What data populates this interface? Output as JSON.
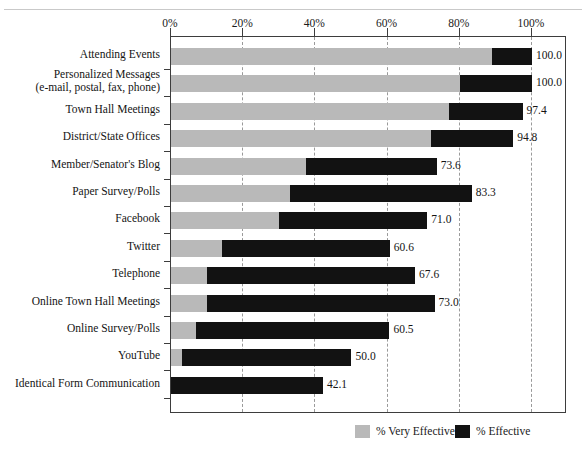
{
  "chart_data": {
    "type": "bar",
    "orientation": "horizontal",
    "stacked": true,
    "title": "",
    "subtitle": "",
    "xlabel": "",
    "ylabel": "",
    "xlim": [
      0,
      100
    ],
    "grid": true,
    "legend_position": "bottom-right",
    "xticks": [
      "0%",
      "20%",
      "40%",
      "60%",
      "80%",
      "100%"
    ],
    "xtick_values": [
      0,
      20,
      40,
      60,
      80,
      100
    ],
    "categories": [
      "Attending Events",
      "Personalized Messages (e-mail, postal, fax, phone)",
      "Town Hall Meetings",
      "District/State Offices",
      "Member/Senator's Blog",
      "Paper Survey/Polls",
      "Facebook",
      "Twitter",
      "Telephone",
      "Online Town Hall Meetings",
      "Online Survey/Polls",
      "YouTube",
      "Identical Form Communication"
    ],
    "series": [
      {
        "name": "% Very Effective",
        "color": "#b9b9b9",
        "values": [
          89.0,
          80.0,
          77.0,
          72.0,
          37.5,
          33.0,
          30.0,
          14.0,
          10.0,
          10.0,
          7.0,
          3.0,
          0.0
        ]
      },
      {
        "name": "% Effective",
        "color": "#121212",
        "values": [
          11.0,
          20.0,
          20.4,
          22.8,
          36.1,
          50.3,
          41.0,
          46.6,
          57.6,
          63.0,
          53.5,
          47.0,
          42.1
        ]
      }
    ],
    "totals": [
      100.0,
      100.0,
      97.4,
      94.8,
      73.6,
      83.3,
      71.0,
      60.6,
      67.6,
      73.0,
      60.5,
      50.0,
      42.1
    ],
    "data_labels": [
      "100.0",
      "100.0",
      "97.4",
      "94.8",
      "73.6",
      "83.3",
      "71.0",
      "60.6",
      "67.6",
      "73.0",
      "60.5",
      "50.0",
      "42.1"
    ]
  },
  "axis": {
    "ticks": [
      {
        "label": "0%",
        "value": 0
      },
      {
        "label": "20%",
        "value": 20
      },
      {
        "label": "40%",
        "value": 40
      },
      {
        "label": "60%",
        "value": 60
      },
      {
        "label": "80%",
        "value": 80
      },
      {
        "label": "100%",
        "value": 100
      }
    ]
  },
  "rows": [
    {
      "label": "Attending Events",
      "label2": "",
      "very": 89.0,
      "effective": 11.0,
      "total": "100.0"
    },
    {
      "label": "Personalized Messages",
      "label2": "(e-mail, postal, fax, phone)",
      "very": 80.0,
      "effective": 20.0,
      "total": "100.0"
    },
    {
      "label": "Town Hall Meetings",
      "label2": "",
      "very": 77.0,
      "effective": 20.4,
      "total": "97.4"
    },
    {
      "label": "District/State Offices",
      "label2": "",
      "very": 72.0,
      "effective": 22.8,
      "total": "94.8"
    },
    {
      "label": "Member/Senator's Blog",
      "label2": "",
      "very": 37.5,
      "effective": 36.1,
      "total": "73.6"
    },
    {
      "label": "Paper Survey/Polls",
      "label2": "",
      "very": 33.0,
      "effective": 50.3,
      "total": "83.3"
    },
    {
      "label": "Facebook",
      "label2": "",
      "very": 30.0,
      "effective": 41.0,
      "total": "71.0"
    },
    {
      "label": "Twitter",
      "label2": "",
      "very": 14.0,
      "effective": 46.6,
      "total": "60.6"
    },
    {
      "label": "Telephone",
      "label2": "",
      "very": 10.0,
      "effective": 57.6,
      "total": "67.6"
    },
    {
      "label": "Online Town Hall Meetings",
      "label2": "",
      "very": 10.0,
      "effective": 63.0,
      "total": "73.0"
    },
    {
      "label": "Online Survey/Polls",
      "label2": "",
      "very": 7.0,
      "effective": 53.5,
      "total": "60.5"
    },
    {
      "label": "YouTube",
      "label2": "",
      "very": 3.0,
      "effective": 47.0,
      "total": "50.0"
    },
    {
      "label": "Identical Form Communication",
      "label2": "",
      "very": 0.0,
      "effective": 42.1,
      "total": "42.1"
    }
  ],
  "legend": {
    "items": [
      {
        "label": "% Very Effective",
        "color": "#b9b9b9"
      },
      {
        "label": "% Effective",
        "color": "#121212"
      }
    ]
  },
  "colors": {
    "very_effective": "#b9b9b9",
    "effective": "#121212",
    "frame": "#3d3d3d",
    "gridline": "#9a9a9a",
    "background": "#ffffff"
  }
}
